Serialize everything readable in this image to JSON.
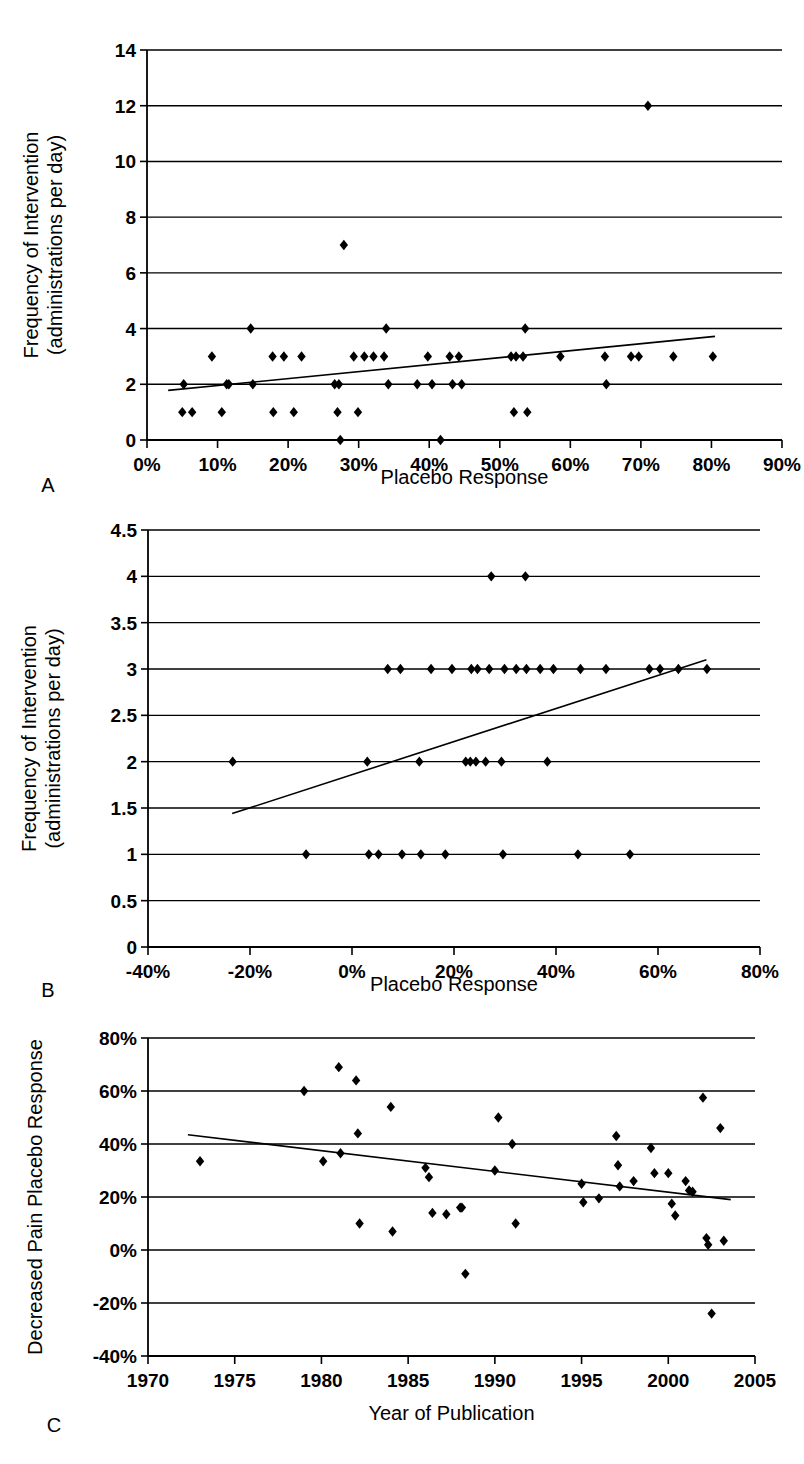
{
  "figure": {
    "panel_labels": {
      "a": "A",
      "b": "B",
      "c": "C"
    }
  },
  "chart_data": [
    {
      "id": "panel-a",
      "type": "scatter",
      "panel_letter": "A",
      "title": "",
      "xlabel": "Placebo Response",
      "ylabel": "Frequency of Intervention\n(administrations per day)",
      "ylabel_line1": "Frequency of Intervention",
      "ylabel_line2": "(administrations per day)",
      "xlim": [
        0,
        90
      ],
      "ylim": [
        0,
        14
      ],
      "xticks": [
        0,
        10,
        20,
        30,
        40,
        50,
        60,
        70,
        80,
        90
      ],
      "xtick_labels": [
        "0%",
        "10%",
        "20%",
        "30%",
        "40%",
        "50%",
        "60%",
        "70%",
        "80%",
        "90%"
      ],
      "yticks": [
        0,
        2,
        4,
        6,
        8,
        10,
        12,
        14
      ],
      "ytick_labels": [
        "0",
        "2",
        "4",
        "6",
        "8",
        "10",
        "12",
        "14"
      ],
      "grid": true,
      "grid_axis": "y",
      "legend": false,
      "points": [
        [
          5.2,
          2
        ],
        [
          5.0,
          1
        ],
        [
          6.4,
          1
        ],
        [
          9.2,
          3
        ],
        [
          10.6,
          1
        ],
        [
          11.3,
          2
        ],
        [
          11.6,
          2
        ],
        [
          14.7,
          4
        ],
        [
          15.0,
          2
        ],
        [
          17.8,
          3
        ],
        [
          17.9,
          1
        ],
        [
          19.4,
          3
        ],
        [
          20.8,
          1
        ],
        [
          21.9,
          3
        ],
        [
          26.6,
          2
        ],
        [
          27.2,
          2
        ],
        [
          27.0,
          1
        ],
        [
          27.4,
          0
        ],
        [
          27.9,
          7
        ],
        [
          29.3,
          3
        ],
        [
          29.9,
          1
        ],
        [
          30.8,
          3
        ],
        [
          32.1,
          3
        ],
        [
          33.6,
          3
        ],
        [
          33.9,
          4
        ],
        [
          34.2,
          2
        ],
        [
          38.3,
          2
        ],
        [
          39.8,
          3
        ],
        [
          40.4,
          2
        ],
        [
          41.6,
          0
        ],
        [
          42.9,
          3
        ],
        [
          43.3,
          2
        ],
        [
          44.2,
          3
        ],
        [
          44.6,
          2
        ],
        [
          51.6,
          3
        ],
        [
          52.3,
          3
        ],
        [
          52.0,
          1
        ],
        [
          53.3,
          3
        ],
        [
          53.6,
          4
        ],
        [
          53.9,
          1
        ],
        [
          58.6,
          3
        ],
        [
          64.9,
          3
        ],
        [
          65.1,
          2
        ],
        [
          68.6,
          3
        ],
        [
          69.7,
          3
        ],
        [
          71.0,
          12
        ],
        [
          74.6,
          3
        ],
        [
          80.2,
          3
        ]
      ],
      "trendline": {
        "x1": 3.0,
        "y1": 1.78,
        "x2": 80.5,
        "y2": 3.72
      }
    },
    {
      "id": "panel-b",
      "type": "scatter",
      "panel_letter": "B",
      "title": "",
      "xlabel": "Placebo Response",
      "ylabel_line1": "Frequency of Intervention",
      "ylabel_line2": "(administrations per day)",
      "xlim": [
        -40,
        80
      ],
      "ylim": [
        0,
        4.5
      ],
      "xticks": [
        -40,
        -20,
        0,
        20,
        40,
        60,
        80
      ],
      "xtick_labels": [
        "-40%",
        "-20%",
        "0%",
        "20%",
        "40%",
        "60%",
        "80%"
      ],
      "yticks": [
        0,
        0.5,
        1,
        1.5,
        2,
        2.5,
        3,
        3.5,
        4,
        4.5
      ],
      "ytick_labels": [
        "0",
        "0.5",
        "1",
        "1.5",
        "2",
        "2.5",
        "3",
        "3.5",
        "4",
        "4.5"
      ],
      "grid": true,
      "grid_axis": "y",
      "legend": false,
      "points": [
        [
          -23.4,
          2
        ],
        [
          -9.0,
          1
        ],
        [
          3.0,
          2
        ],
        [
          3.3,
          1
        ],
        [
          5.2,
          1
        ],
        [
          7.0,
          3
        ],
        [
          9.5,
          3
        ],
        [
          9.8,
          1
        ],
        [
          13.2,
          2
        ],
        [
          13.5,
          1
        ],
        [
          15.5,
          3
        ],
        [
          18.3,
          1
        ],
        [
          19.6,
          3
        ],
        [
          22.3,
          2
        ],
        [
          23.2,
          2
        ],
        [
          23.4,
          3
        ],
        [
          24.3,
          2
        ],
        [
          24.6,
          3
        ],
        [
          26.2,
          2
        ],
        [
          26.9,
          3
        ],
        [
          27.3,
          4
        ],
        [
          29.3,
          2
        ],
        [
          29.6,
          1
        ],
        [
          29.9,
          3
        ],
        [
          32.2,
          3
        ],
        [
          34.0,
          4
        ],
        [
          34.2,
          3
        ],
        [
          36.9,
          3
        ],
        [
          38.3,
          2
        ],
        [
          39.5,
          3
        ],
        [
          44.3,
          1
        ],
        [
          44.8,
          3
        ],
        [
          49.8,
          3
        ],
        [
          54.5,
          1
        ],
        [
          58.3,
          3
        ],
        [
          60.4,
          3
        ],
        [
          64.0,
          3
        ],
        [
          69.6,
          3
        ]
      ],
      "trendline": {
        "x1": -23.5,
        "y1": 1.44,
        "x2": 69.5,
        "y2": 3.1
      }
    },
    {
      "id": "panel-c",
      "type": "scatter",
      "panel_letter": "C",
      "title": "",
      "xlabel": "Year of Publication",
      "ylabel_line1": "Decreased Pain Placebo Response",
      "xlim": [
        1970,
        2005
      ],
      "ylim": [
        -40,
        80
      ],
      "xticks": [
        1970,
        1975,
        1980,
        1985,
        1990,
        1995,
        2000,
        2005
      ],
      "xtick_labels": [
        "1970",
        "1975",
        "1980",
        "1985",
        "1990",
        "1995",
        "2000",
        "2005"
      ],
      "yticks": [
        -40,
        -20,
        0,
        20,
        40,
        60,
        80
      ],
      "ytick_labels": [
        "-40%",
        "-20%",
        "0%",
        "20%",
        "40%",
        "60%",
        "80%"
      ],
      "grid": true,
      "grid_axis": "y",
      "legend": false,
      "points": [
        [
          1973.0,
          33.5
        ],
        [
          1979.0,
          60.0
        ],
        [
          1980.1,
          33.5
        ],
        [
          1981.0,
          69.0
        ],
        [
          1981.1,
          36.5
        ],
        [
          1982.0,
          64.0
        ],
        [
          1982.1,
          44.0
        ],
        [
          1982.2,
          10.0
        ],
        [
          1984.0,
          54.0
        ],
        [
          1984.1,
          7.0
        ],
        [
          1986.0,
          31.0
        ],
        [
          1986.2,
          27.5
        ],
        [
          1986.4,
          14.0
        ],
        [
          1987.2,
          13.5
        ],
        [
          1988.0,
          16.0
        ],
        [
          1988.1,
          16.0
        ],
        [
          1988.3,
          -9.0
        ],
        [
          1990.0,
          30.0
        ],
        [
          1990.2,
          50.0
        ],
        [
          1991.0,
          40.0
        ],
        [
          1991.2,
          10.0
        ],
        [
          1995.0,
          25.0
        ],
        [
          1995.1,
          18.0
        ],
        [
          1996.0,
          19.5
        ],
        [
          1997.0,
          43.0
        ],
        [
          1997.1,
          32.0
        ],
        [
          1997.2,
          24.0
        ],
        [
          1998.0,
          26.0
        ],
        [
          1999.0,
          38.5
        ],
        [
          1999.2,
          29.0
        ],
        [
          2000.0,
          29.0
        ],
        [
          2000.2,
          17.5
        ],
        [
          2000.4,
          13.0
        ],
        [
          2001.0,
          26.0
        ],
        [
          2001.2,
          22.5
        ],
        [
          2001.4,
          22.0
        ],
        [
          2002.0,
          57.5
        ],
        [
          2002.2,
          4.5
        ],
        [
          2002.3,
          2.0
        ],
        [
          2002.5,
          -24.0
        ],
        [
          2003.0,
          46.0
        ],
        [
          2003.2,
          3.5
        ]
      ],
      "trendline": {
        "x1": 1972.3,
        "y1": 43.5,
        "x2": 2003.6,
        "y2": 19.0
      }
    }
  ]
}
